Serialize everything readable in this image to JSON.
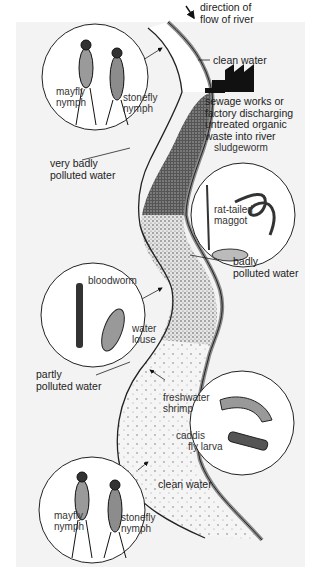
{
  "diagram": {
    "flow_label": "direction of\nflow of river",
    "flow_label_lines": [
      "direction of",
      "flow of river"
    ],
    "pollution_source_lines": [
      "sewage works or",
      "factory discharging",
      "untreated organic",
      "waste into river"
    ],
    "zones": [
      {
        "id": "clean-upstream",
        "label": "clean water"
      },
      {
        "id": "very-badly",
        "label_lines": [
          "very badly",
          "polluted water"
        ]
      },
      {
        "id": "badly",
        "label_lines": [
          "badly",
          "polluted water"
        ]
      },
      {
        "id": "partly",
        "label_lines": [
          "partly",
          "polluted water"
        ]
      },
      {
        "id": "clean-downstream",
        "label": "clean water"
      }
    ],
    "circles": [
      {
        "id": "upstream-nymphs",
        "organisms": [
          {
            "lines": [
              "mayfly",
              "nymph"
            ]
          },
          {
            "lines": [
              "stonefly",
              "nymph"
            ]
          }
        ]
      },
      {
        "id": "sludge",
        "organisms": [
          {
            "lines": [
              "sludgeworm"
            ]
          },
          {
            "lines": [
              "rat-tailed",
              "maggot"
            ]
          }
        ]
      },
      {
        "id": "bloodworm",
        "organisms": [
          {
            "lines": [
              "bloodworm"
            ]
          },
          {
            "lines": [
              "water",
              "louse"
            ]
          }
        ]
      },
      {
        "id": "shrimp",
        "organisms": [
          {
            "lines": [
              "freshwater",
              "shrimp"
            ]
          },
          {
            "lines": [
              "caddis",
              "fly larva"
            ]
          }
        ]
      },
      {
        "id": "downstream-nymphs",
        "organisms": [
          {
            "lines": [
              "mayfly",
              "nymph"
            ]
          },
          {
            "lines": [
              "stonefly",
              "nymph"
            ]
          }
        ]
      }
    ],
    "colors": {
      "panel": "#f3f3f3",
      "ink": "#1a1a1a",
      "bank": "#8a8a8a",
      "factory": "#111111"
    }
  }
}
